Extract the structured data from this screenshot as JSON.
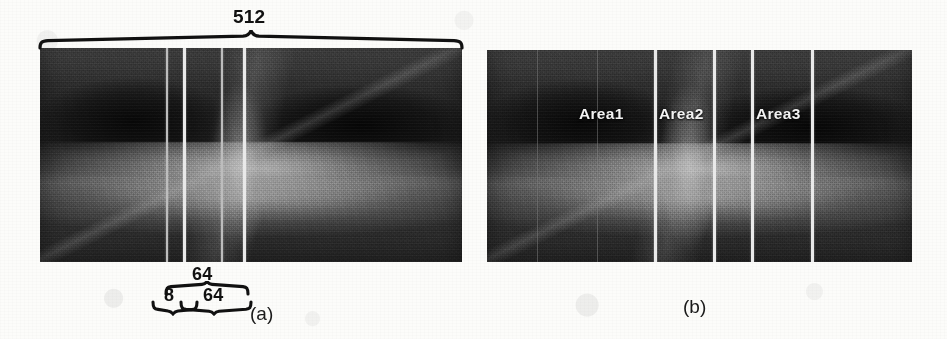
{
  "figure": {
    "caption_a": "(a)",
    "caption_b": "(b)"
  },
  "panel_a": {
    "name": "OCT B-scan with patch-size annotations",
    "top_brace_label": "512",
    "bottom_brace_upper_label": "64",
    "bottom_brace_lower_left_label": "8",
    "bottom_brace_lower_right_label": "64",
    "division_lines": 4,
    "line_color": "#e9e9e9",
    "annotation_color": "#111111"
  },
  "panel_b": {
    "name": "OCT B-scan divided into three labelled areas",
    "areas": [
      {
        "label": "Area1"
      },
      {
        "label": "Area2"
      },
      {
        "label": "Area3"
      }
    ],
    "division_lines": 4,
    "line_color": "#e9e9e9",
    "label_color": "#f2f2f2"
  }
}
